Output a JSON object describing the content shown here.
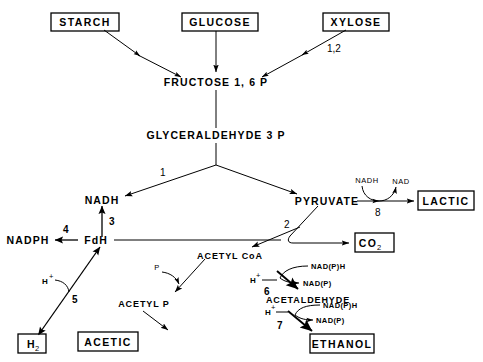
{
  "diagram": {
    "nodes": {
      "starch": "STARCH",
      "glucose": "GLUCOSE",
      "xylose": "XYLOSE",
      "fructose": "FRUCTOSE  1, 6 P",
      "glyceraldehyde": "GLYCERALDEHYDE  3 P",
      "nadh": "NADH",
      "pyruvate": "PYRUVATE",
      "lactic": "LACTIC",
      "nadph": "NADPH",
      "fdh": "FdH",
      "co2_main": "CO",
      "co2_sub": "2",
      "acetyl_coa": "ACETYL  CoA",
      "acetyl_p": "ACETYL  P",
      "acetaldehyde": "ACETALDEHYDE",
      "ethanol": "ETHANOL",
      "acetic": "ACETIC",
      "h2_main": "H",
      "h2_sub": "2"
    },
    "step_numbers": {
      "xylose_step": "1,2",
      "glyceraldehyde_step": "1",
      "pyruvate_step": "2",
      "nadh_step": "3",
      "nadph_step": "4",
      "h2_step": "5",
      "acetaldehyde_step": "6",
      "ethanol_step": "7",
      "lactic_step": "8"
    },
    "cofactors": {
      "lactic_in": "NADH",
      "lactic_out": "NAD",
      "acetyl_p_in": "P",
      "acetaldehyde_in": "NAD(P)H",
      "acetaldehyde_out": "NAD(P)",
      "acetaldehyde_hplus": "H",
      "ethanol_in": "NAD(P)H",
      "ethanol_out": "NAD(P)",
      "ethanol_hplus": "H",
      "h2_hplus": "H",
      "hplus_sup": "+"
    }
  }
}
